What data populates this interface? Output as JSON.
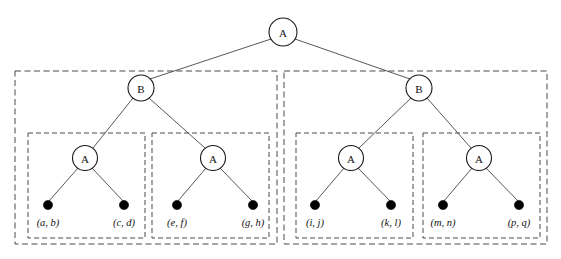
{
  "figure": {
    "kind": "hierarchical-tree-diagram",
    "background_color": "#ffffff",
    "line_color": "#444444",
    "box_stroke_color": "#4a4a4a",
    "node_fill_color": "#ffffff",
    "node_stroke_color": "#1a1a1a",
    "leaf_dot_color": "#000000"
  },
  "chart_data": {
    "type": "diagram",
    "title": "",
    "nodes": [
      {
        "id": "root",
        "label": "A",
        "level": 0,
        "cx": 283,
        "cy": 32,
        "r": 14
      },
      {
        "id": "b-left",
        "label": "B",
        "level": 1,
        "cx": 141,
        "cy": 88,
        "r": 13
      },
      {
        "id": "b-right",
        "label": "B",
        "level": 1,
        "cx": 419,
        "cy": 88,
        "r": 13
      },
      {
        "id": "a-1",
        "label": "A",
        "level": 2,
        "cx": 85,
        "cy": 158,
        "r": 12.5
      },
      {
        "id": "a-2",
        "label": "A",
        "level": 2,
        "cx": 213,
        "cy": 158,
        "r": 12.5
      },
      {
        "id": "a-3",
        "label": "A",
        "level": 2,
        "cx": 351,
        "cy": 158,
        "r": 12.5
      },
      {
        "id": "a-4",
        "label": "A",
        "level": 2,
        "cx": 479,
        "cy": 158,
        "r": 12.5
      }
    ],
    "leaves": [
      {
        "id": "leaf-1",
        "label": "(a, b)",
        "cx": 48,
        "cy": 205,
        "r": 4.6,
        "label_x": 48,
        "label_y": 226
      },
      {
        "id": "leaf-2",
        "label": "(c, d)",
        "cx": 124,
        "cy": 205,
        "r": 4.6,
        "label_x": 124,
        "label_y": 226
      },
      {
        "id": "leaf-3",
        "label": "(e, f)",
        "cx": 177,
        "cy": 205,
        "r": 4.6,
        "label_x": 177,
        "label_y": 226
      },
      {
        "id": "leaf-4",
        "label": "(g, h)",
        "cx": 253,
        "cy": 205,
        "r": 4.6,
        "label_x": 253,
        "label_y": 226
      },
      {
        "id": "leaf-5",
        "label": "(i, j)",
        "cx": 315,
        "cy": 205,
        "r": 4.6,
        "label_x": 315,
        "label_y": 226
      },
      {
        "id": "leaf-6",
        "label": "(k, l)",
        "cx": 391,
        "cy": 205,
        "r": 4.6,
        "label_x": 391,
        "label_y": 226
      },
      {
        "id": "leaf-7",
        "label": "(m, n)",
        "cx": 443,
        "cy": 205,
        "r": 4.6,
        "label_x": 443,
        "label_y": 226
      },
      {
        "id": "leaf-8",
        "label": "(p, q)",
        "cx": 519,
        "cy": 205,
        "r": 4.6,
        "label_x": 519,
        "label_y": 226
      }
    ],
    "edges": [
      {
        "from": "root",
        "to": "b-left",
        "x1": 271,
        "y1": 39,
        "x2": 150,
        "y2": 79
      },
      {
        "from": "root",
        "to": "b-right",
        "x1": 295,
        "y1": 39,
        "x2": 410,
        "y2": 79
      },
      {
        "from": "b-left",
        "to": "a-1",
        "x1": 133,
        "y1": 98,
        "x2": 93,
        "y2": 148
      },
      {
        "from": "b-left",
        "to": "a-2",
        "x1": 149,
        "y1": 98,
        "x2": 205,
        "y2": 148
      },
      {
        "from": "b-right",
        "to": "a-3",
        "x1": 411,
        "y1": 98,
        "x2": 359,
        "y2": 148
      },
      {
        "from": "b-right",
        "to": "a-4",
        "x1": 427,
        "y1": 98,
        "x2": 471,
        "y2": 148
      },
      {
        "from": "a-1",
        "to": "leaf-1",
        "x1": 78,
        "y1": 168,
        "x2": 49,
        "y2": 201
      },
      {
        "from": "a-1",
        "to": "leaf-2",
        "x1": 92,
        "y1": 168,
        "x2": 123,
        "y2": 201
      },
      {
        "from": "a-2",
        "to": "leaf-3",
        "x1": 206,
        "y1": 168,
        "x2": 178,
        "y2": 201
      },
      {
        "from": "a-2",
        "to": "leaf-4",
        "x1": 220,
        "y1": 168,
        "x2": 252,
        "y2": 201
      },
      {
        "from": "a-3",
        "to": "leaf-5",
        "x1": 344,
        "y1": 168,
        "x2": 316,
        "y2": 201
      },
      {
        "from": "a-3",
        "to": "leaf-6",
        "x1": 358,
        "y1": 168,
        "x2": 390,
        "y2": 201
      },
      {
        "from": "a-4",
        "to": "leaf-7",
        "x1": 472,
        "y1": 168,
        "x2": 444,
        "y2": 201
      },
      {
        "from": "a-4",
        "to": "leaf-8",
        "x1": 486,
        "y1": 168,
        "x2": 518,
        "y2": 201
      }
    ],
    "group_boxes": [
      {
        "id": "outer-left",
        "role": "outer",
        "x": 15,
        "y": 71,
        "width": 262,
        "height": 173
      },
      {
        "id": "outer-right",
        "role": "outer",
        "x": 284,
        "y": 71,
        "width": 263,
        "height": 173
      },
      {
        "id": "inner-1",
        "role": "inner",
        "x": 28,
        "y": 133,
        "width": 117,
        "height": 105
      },
      {
        "id": "inner-2",
        "role": "inner",
        "x": 152,
        "y": 133,
        "width": 117,
        "height": 105
      },
      {
        "id": "inner-3",
        "role": "inner",
        "x": 296,
        "y": 133,
        "width": 117,
        "height": 105
      },
      {
        "id": "inner-4",
        "role": "inner",
        "x": 423,
        "y": 133,
        "width": 117,
        "height": 105
      }
    ]
  }
}
